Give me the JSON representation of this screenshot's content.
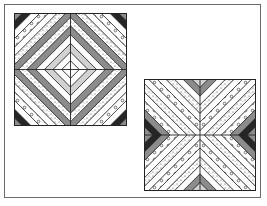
{
  "figure": {
    "colors": {
      "white": "#ffffff",
      "light": "#d2d2d2",
      "gray": "#8c8c8c",
      "dark": "#262626",
      "line": "#222222",
      "frame": "#6a6a6a"
    },
    "blocks": [
      {
        "name": "concentric-diamond-block",
        "x": 14,
        "y": 13,
        "size": 113,
        "pattern": "diamond",
        "strips": [
          "gray",
          "dark",
          "white",
          "circles",
          "white",
          "stipple",
          "gray",
          "stipple",
          "gray",
          "white",
          "light",
          "white",
          "white"
        ]
      },
      {
        "name": "x-chevron-block",
        "x": 144,
        "y": 79,
        "size": 112,
        "pattern": "x",
        "strips": [
          "light",
          "gray",
          "white",
          "stipple",
          "white",
          "circles",
          "white",
          "stipple",
          "white",
          "circles",
          "gray",
          "dark",
          "gray"
        ]
      }
    ]
  }
}
